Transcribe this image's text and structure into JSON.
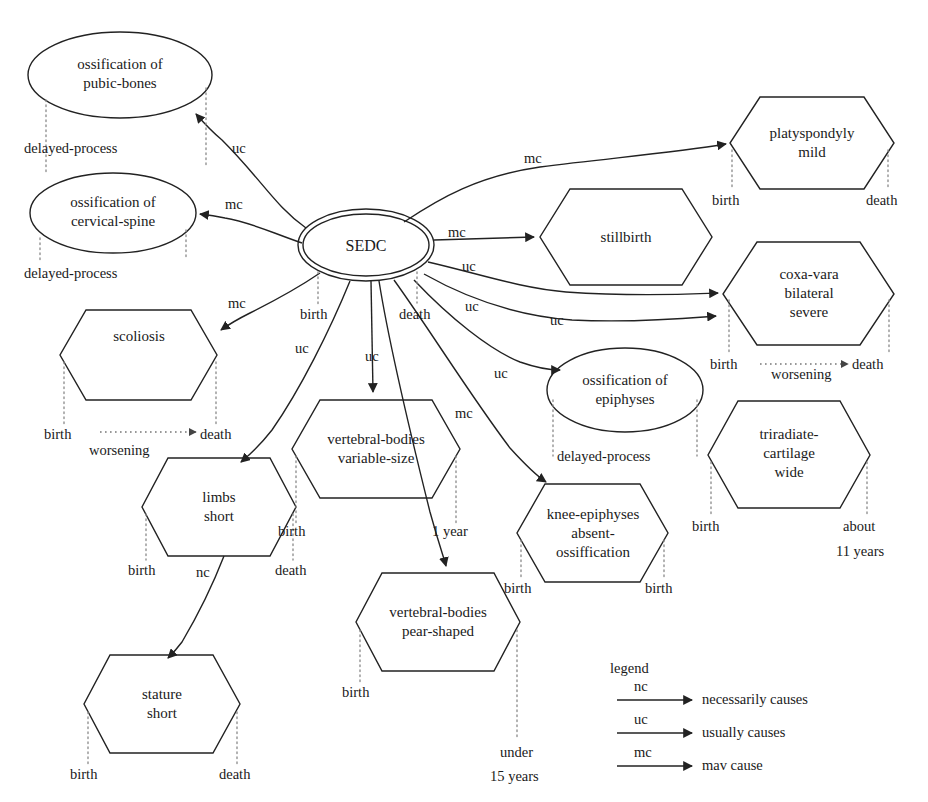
{
  "figure": {
    "root_node": "SEDC",
    "stroke_color": "#222222",
    "text_color": "#1a1a1a",
    "background": "#ffffff"
  },
  "nodes": [
    {
      "id": "ossification-pubic-bones",
      "shape": "ellipse",
      "lines": [
        "ossification of",
        "pubic-bones"
      ],
      "timeline": {
        "left": "",
        "right": "",
        "under": "delayed-process"
      }
    },
    {
      "id": "ossification-cervical-spine",
      "shape": "ellipse",
      "lines": [
        "ossification of",
        "cervical-spine"
      ],
      "timeline": {
        "left": "",
        "right": "",
        "under": "delayed-process"
      }
    },
    {
      "id": "sedc",
      "shape": "double-ellipse",
      "lines": [
        "SEDC"
      ],
      "timeline": {
        "left": "birth",
        "right": "death",
        "under": ""
      }
    },
    {
      "id": "platyspondyly-mild",
      "shape": "hexagon",
      "lines": [
        "platyspondyly",
        "mild"
      ],
      "timeline": {
        "left": "birth",
        "right": "death",
        "under": ""
      }
    },
    {
      "id": "stillbirth",
      "shape": "hexagon",
      "lines": [
        "stillbirth"
      ],
      "timeline": {
        "left": "",
        "right": "",
        "under": ""
      }
    },
    {
      "id": "coxa-vara-bilateral-severe",
      "shape": "hexagon",
      "lines": [
        "coxa-vara",
        "bilateral",
        "severe"
      ],
      "timeline": {
        "left": "birth",
        "right": "death",
        "under": "worsening"
      }
    },
    {
      "id": "scoliosis",
      "shape": "hexagon",
      "lines": [
        "scoliosis"
      ],
      "timeline": {
        "left": "birth",
        "right": "death",
        "under": "worsening"
      }
    },
    {
      "id": "ossification-epiphyses",
      "shape": "ellipse",
      "lines": [
        "ossification of",
        "epiphyses"
      ],
      "timeline": {
        "left": "",
        "right": "",
        "under": "delayed-process"
      }
    },
    {
      "id": "triradiate-cartilage-wide",
      "shape": "hexagon",
      "lines": [
        "triradiate-",
        "cartilage",
        "wide"
      ],
      "timeline": {
        "left": "birth",
        "right": "about 11 years",
        "under": ""
      }
    },
    {
      "id": "vertebral-bodies-variable-size",
      "shape": "hexagon",
      "lines": [
        "vertebral-bodies",
        "variable-size"
      ],
      "timeline": {
        "left": "birth",
        "right": "1 year",
        "under": ""
      }
    },
    {
      "id": "limbs-short",
      "shape": "hexagon",
      "lines": [
        "limbs",
        "short"
      ],
      "timeline": {
        "left": "birth",
        "right": "death",
        "under": ""
      }
    },
    {
      "id": "knee-epiphyses-absent-ossification",
      "shape": "hexagon",
      "lines": [
        "knee-epiphyses",
        "absent-",
        "ossiffication"
      ],
      "timeline": {
        "left": "birth",
        "right": "birth",
        "under": ""
      }
    },
    {
      "id": "vertebral-bodies-pear-shaped",
      "shape": "hexagon",
      "lines": [
        "vertebral-bodies",
        "pear-shaped"
      ],
      "timeline": {
        "left": "birth",
        "right": "under 15 years",
        "under": ""
      }
    },
    {
      "id": "stature-short",
      "shape": "hexagon",
      "lines": [
        "stature",
        "short"
      ],
      "timeline": {
        "left": "birth",
        "right": "death",
        "under": ""
      }
    }
  ],
  "edges": [
    {
      "from": "sedc",
      "to": "ossification-pubic-bones",
      "label": "uc"
    },
    {
      "from": "sedc",
      "to": "ossification-cervical-spine",
      "label": "mc"
    },
    {
      "from": "sedc",
      "to": "scoliosis",
      "label": "mc"
    },
    {
      "from": "sedc",
      "to": "platyspondyly-mild",
      "label": "mc"
    },
    {
      "from": "sedc",
      "to": "stillbirth",
      "label": "mc"
    },
    {
      "from": "sedc",
      "to": "coxa-vara-bilateral-severe",
      "label": "uc"
    },
    {
      "from": "sedc",
      "to": "triradiate-cartilage-wide",
      "label": "uc"
    },
    {
      "from": "sedc",
      "to": "ossification-epiphyses",
      "label": "uc"
    },
    {
      "from": "sedc",
      "to": "vertebral-bodies-variable-size",
      "label": "uc"
    },
    {
      "from": "sedc",
      "to": "limbs-short",
      "label": "uc"
    },
    {
      "from": "sedc",
      "to": "knee-epiphyses-absent-ossification",
      "label": "uc"
    },
    {
      "from": "sedc",
      "to": "vertebral-bodies-pear-shaped",
      "label": "mc"
    },
    {
      "from": "limbs-short",
      "to": "stature-short",
      "label": "nc"
    }
  ],
  "timeline_labels": {
    "pubic_under": "delayed-process",
    "cervical_under": "delayed-process",
    "epiphyses_under": "delayed-process",
    "sedc_birth": "birth",
    "sedc_death": "death",
    "platyspondyly_birth": "birth",
    "platyspondyly_death": "death",
    "coxavara_birth": "birth",
    "coxavara_worsening": "worsening",
    "coxavara_death": "death",
    "scoliosis_birth": "birth",
    "scoliosis_worsening": "worsening",
    "scoliosis_death": "death",
    "triradiate_birth": "birth",
    "triradiate_about": "about",
    "triradiate_years": "11 years",
    "vbvs_birth": "birth",
    "vbvs_1year": "1 year",
    "limbs_birth": "birth",
    "limbs_death": "death",
    "knee_birth_left": "birth",
    "knee_birth_right": "birth",
    "vbps_birth": "birth",
    "vbps_under": "under",
    "vbps_years": "15 years",
    "stature_birth": "birth",
    "stature_death": "death"
  },
  "edge_labels": {
    "uc_pubic": "uc",
    "mc_cervical": "mc",
    "mc_scoliosis": "mc",
    "mc_platyspondyly": "mc",
    "mc_stillbirth": "mc",
    "uc_coxavara": "uc",
    "uc_triradiate": "uc",
    "uc_epiphyses": "uc",
    "uc_vbvs": "uc",
    "uc_limbs": "uc",
    "uc_knee": "uc",
    "mc_vbps": "mc",
    "nc_stature": "nc"
  },
  "legend": {
    "title": "legend",
    "entries": [
      {
        "code": "nc",
        "text": "necessarily causes"
      },
      {
        "code": "uc",
        "text": "usually causes"
      },
      {
        "code": "mc",
        "text": "mav cause"
      }
    ]
  },
  "node_text": {
    "pubic_l1": "ossification of",
    "pubic_l2": "pubic-bones",
    "cervical_l1": "ossification of",
    "cervical_l2": "cervical-spine",
    "sedc": "SEDC",
    "platyspondyly_l1": "platyspondyly",
    "platyspondyly_l2": "mild",
    "stillbirth": "stillbirth",
    "coxavara_l1": "coxa-vara",
    "coxavara_l2": "bilateral",
    "coxavara_l3": "severe",
    "scoliosis": "scoliosis",
    "epiphyses_l1": "ossification of",
    "epiphyses_l2": "epiphyses",
    "triradiate_l1": "triradiate-",
    "triradiate_l2": "cartilage",
    "triradiate_l3": "wide",
    "vbvs_l1": "vertebral-bodies",
    "vbvs_l2": "variable-size",
    "limbs_l1": "limbs",
    "limbs_l2": "short",
    "knee_l1": "knee-epiphyses",
    "knee_l2": "absent-",
    "knee_l3": "ossiffication",
    "vbps_l1": "vertebral-bodies",
    "vbps_l2": "pear-shaped",
    "stature_l1": "stature",
    "stature_l2": "short"
  }
}
